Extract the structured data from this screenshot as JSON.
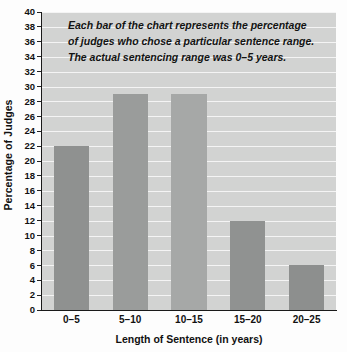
{
  "chart_data": {
    "type": "bar",
    "title": "",
    "categories": [
      "0–5",
      "5–10",
      "10–15",
      "15–20",
      "20–25"
    ],
    "values": [
      22,
      29,
      29,
      12,
      6
    ],
    "xlabel": "Length of Sentence (in years)",
    "ylabel": "Percentage of Judges",
    "ylim": [
      0,
      40
    ],
    "ytick_step": 2,
    "yticks": [
      40,
      38,
      36,
      34,
      32,
      30,
      28,
      26,
      24,
      22,
      20,
      18,
      16,
      14,
      12,
      10,
      8,
      6,
      4,
      2,
      0
    ],
    "grid": true,
    "grid_orientation": "horizontal",
    "legend": null,
    "annotations": [
      "Each bar of the chart represents the percentage",
      "of judges who chose a particular sentence range.",
      "The actual sentencing range was 0–5 years."
    ],
    "colors": {
      "bars": [
        "#8f9190",
        "#9a9c9b",
        "#a6a8a7",
        "#909291",
        "#8d8f8e"
      ],
      "plot_background": "#d2d3d2",
      "gridline": "#f4f4f4",
      "axis": "#1a1a1a",
      "text": "#111111",
      "figure_background": "#fdfdfd"
    }
  }
}
